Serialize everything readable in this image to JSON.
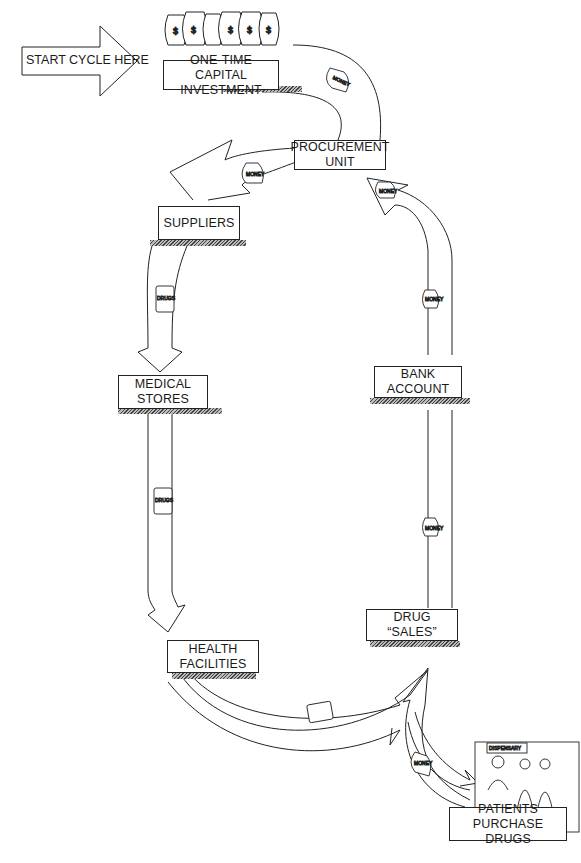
{
  "diagram": {
    "type": "cycle-flow",
    "start_arrow": {
      "label": "START CYCLE HERE"
    },
    "nodes": [
      {
        "id": "capital",
        "lines": [
          "ONE-TIME CAPITAL",
          "INVESTMENT"
        ]
      },
      {
        "id": "procurement",
        "lines": [
          "PROCUREMENT",
          "UNIT"
        ]
      },
      {
        "id": "suppliers",
        "lines": [
          "SUPPLIERS"
        ]
      },
      {
        "id": "medical_stores",
        "lines": [
          "MEDICAL",
          "STORES"
        ]
      },
      {
        "id": "health_facilities",
        "lines": [
          "HEALTH",
          "FACILITIES"
        ]
      },
      {
        "id": "drug_sales",
        "lines": [
          "DRUG “SALES”"
        ]
      },
      {
        "id": "bank_account",
        "lines": [
          "BANK",
          "ACCOUNT"
        ]
      },
      {
        "id": "patients",
        "lines": [
          "PATIENTS PURCHASE",
          "DRUGS"
        ]
      }
    ],
    "edges": [
      {
        "from": "capital",
        "to": "procurement",
        "carries": "MONEY"
      },
      {
        "from": "procurement",
        "to": "suppliers",
        "carries": "MONEY"
      },
      {
        "from": "suppliers",
        "to": "medical_stores",
        "carries": "DRUGS"
      },
      {
        "from": "medical_stores",
        "to": "health_facilities",
        "carries": "DRUGS"
      },
      {
        "from": "health_facilities",
        "to": "drug_sales",
        "carries": "DRUGS"
      },
      {
        "from": "drug_sales",
        "to": "patients",
        "carries": "DRUGS"
      },
      {
        "from": "patients",
        "to": "drug_sales",
        "carries": "MONEY"
      },
      {
        "from": "drug_sales",
        "to": "bank_account",
        "carries": "MONEY"
      },
      {
        "from": "bank_account",
        "to": "procurement",
        "carries": "MONEY"
      }
    ],
    "icon_labels": {
      "money": "MONEY",
      "drugs": "DRUGS",
      "dispensary": "DISPENSARY",
      "dollar": "$"
    }
  }
}
